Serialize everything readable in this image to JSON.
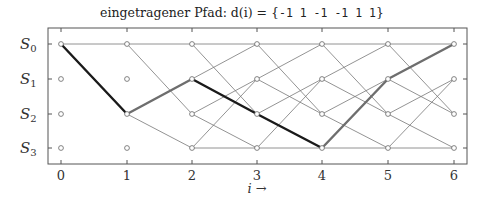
{
  "title": {
    "prefix": "eingetragener Pfad: d(i) = {",
    "sequence": "-1 1 -1 -1 1 1",
    "suffix": "}"
  },
  "axes": {
    "x_label": "i →",
    "x_ticks": [
      "0",
      "1",
      "2",
      "3",
      "4",
      "5",
      "6"
    ],
    "y_labels": [
      {
        "base": "S",
        "sub": "0"
      },
      {
        "base": "S",
        "sub": "1"
      },
      {
        "base": "S",
        "sub": "2"
      },
      {
        "base": "S",
        "sub": "3"
      }
    ]
  },
  "colors": {
    "frame": "#555555",
    "trellis_edge": "#777777",
    "path_minus_one": "#1a1a1a",
    "path_plus_one": "#6e6e6e",
    "node_stroke": "#666666"
  },
  "chart_data": {
    "type": "trellis",
    "title": "eingetragener Pfad: d(i) = {-1 1 -1 -1 1 1}",
    "xlabel": "i →",
    "ylabel": "",
    "x": [
      0,
      1,
      2,
      3,
      4,
      5,
      6
    ],
    "states": [
      "S0",
      "S1",
      "S2",
      "S3"
    ],
    "input_sequence": [
      -1,
      1,
      -1,
      -1,
      1,
      1
    ],
    "path_states": [
      "S0",
      "S2",
      "S1",
      "S2",
      "S3",
      "S1",
      "S0"
    ],
    "transitions": {
      "0-1": [
        [
          "S0",
          "S0"
        ],
        [
          "S0",
          "S2"
        ]
      ],
      "1-2": [
        [
          "S0",
          "S0"
        ],
        [
          "S0",
          "S2"
        ],
        [
          "S2",
          "S1"
        ],
        [
          "S2",
          "S3"
        ]
      ],
      "2-3": [
        [
          "S0",
          "S0"
        ],
        [
          "S0",
          "S2"
        ],
        [
          "S1",
          "S0"
        ],
        [
          "S1",
          "S2"
        ],
        [
          "S2",
          "S1"
        ],
        [
          "S2",
          "S3"
        ],
        [
          "S3",
          "S1"
        ],
        [
          "S3",
          "S3"
        ]
      ],
      "3-4": [
        [
          "S0",
          "S0"
        ],
        [
          "S0",
          "S2"
        ],
        [
          "S1",
          "S0"
        ],
        [
          "S1",
          "S2"
        ],
        [
          "S2",
          "S1"
        ],
        [
          "S2",
          "S3"
        ],
        [
          "S3",
          "S1"
        ],
        [
          "S3",
          "S3"
        ]
      ],
      "4-5": [
        [
          "S0",
          "S0"
        ],
        [
          "S0",
          "S2"
        ],
        [
          "S1",
          "S0"
        ],
        [
          "S1",
          "S2"
        ],
        [
          "S2",
          "S1"
        ],
        [
          "S2",
          "S3"
        ],
        [
          "S3",
          "S1"
        ],
        [
          "S3",
          "S3"
        ]
      ],
      "5-6": [
        [
          "S0",
          "S0"
        ],
        [
          "S0",
          "S2"
        ],
        [
          "S1",
          "S0"
        ],
        [
          "S1",
          "S2"
        ],
        [
          "S2",
          "S1"
        ],
        [
          "S2",
          "S3"
        ],
        [
          "S3",
          "S1"
        ],
        [
          "S3",
          "S3"
        ]
      ]
    },
    "legend": "black segment = input -1, gray segment = input +1",
    "grid": false
  }
}
